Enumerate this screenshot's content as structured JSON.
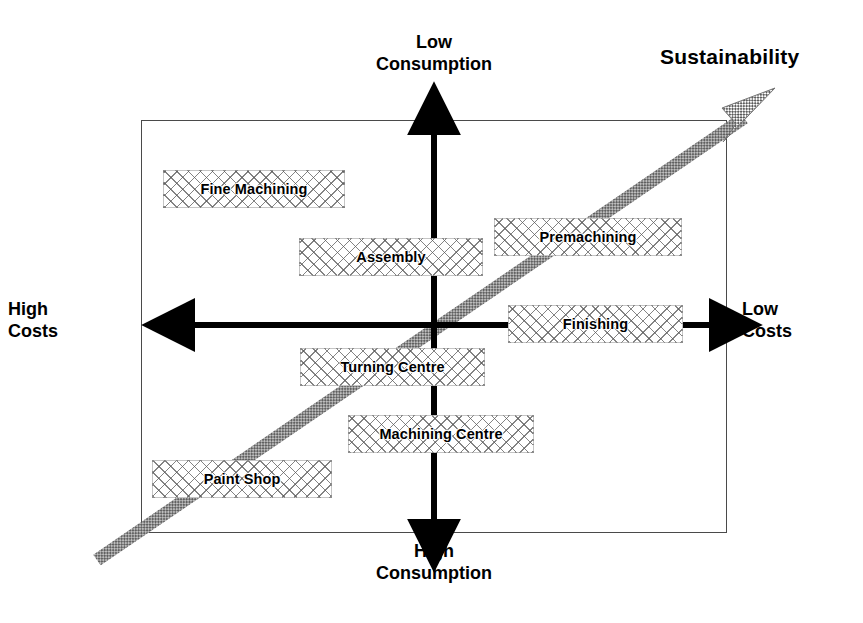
{
  "diagram": {
    "frame_color": "#4a4a4a",
    "axes": {
      "vertical": {
        "top_label": "Low\nConsumption",
        "bottom_label": "High\nConsumption"
      },
      "horizontal": {
        "left_label": "High\nCosts",
        "right_label": "Low\nCosts"
      },
      "diagonal": {
        "label": "Sustainability",
        "direction": "bottom-left to top-right",
        "color": "#6f6f6f"
      }
    },
    "items": [
      {
        "id": "fine-machining",
        "label": "Fine Machining",
        "x": 163,
        "y": 170,
        "w": 182,
        "h": 38
      },
      {
        "id": "premachining",
        "label": "Premachining",
        "x": 494,
        "y": 218,
        "w": 188,
        "h": 38
      },
      {
        "id": "assembly",
        "label": "Assembly",
        "x": 299,
        "y": 238,
        "w": 184,
        "h": 38
      },
      {
        "id": "finishing",
        "label": "Finishing",
        "x": 508,
        "y": 305,
        "w": 175,
        "h": 38
      },
      {
        "id": "turning-centre",
        "label": "Turning Centre",
        "x": 300,
        "y": 348,
        "w": 185,
        "h": 38
      },
      {
        "id": "machining-centre",
        "label": "Machining Centre",
        "x": 348,
        "y": 415,
        "w": 186,
        "h": 38
      },
      {
        "id": "paint-shop",
        "label": "Paint Shop",
        "x": 152,
        "y": 460,
        "w": 180,
        "h": 38
      }
    ]
  }
}
